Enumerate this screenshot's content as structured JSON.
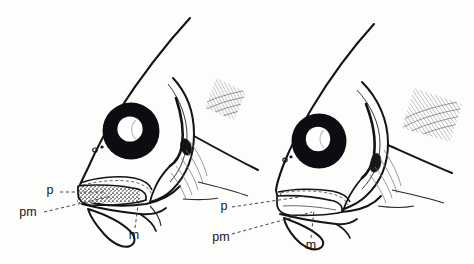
{
  "figure": {
    "name": "fish-head-jaw-anatomy-comparison",
    "background_color": "#fdfdfb",
    "ink_color": "#141418",
    "specimens": [
      {
        "id": "left-specimen",
        "position": "left",
        "description": "Fish head in lateral view with protruded jaws, stippled premaxilla",
        "labels": [
          {
            "key": "p",
            "text": "p",
            "x": 50,
            "y": 194
          },
          {
            "key": "pm",
            "text": "pm",
            "x": 24,
            "y": 216
          },
          {
            "key": "m",
            "text": "m",
            "x": 131,
            "y": 237
          }
        ]
      },
      {
        "id": "right-specimen",
        "position": "right",
        "description": "Fish head in lateral view with retracted jaws, unstippled premaxilla",
        "labels": [
          {
            "key": "p",
            "text": "p",
            "x": 222,
            "y": 209
          },
          {
            "key": "pm",
            "text": "pm",
            "x": 213,
            "y": 239
          },
          {
            "key": "m",
            "text": "m",
            "x": 308,
            "y": 247
          }
        ]
      }
    ],
    "legend_keys": [
      {
        "abbr": "p",
        "meaning": "palatine"
      },
      {
        "abbr": "pm",
        "meaning": "premaxilla"
      },
      {
        "abbr": "m",
        "meaning": "maxilla"
      }
    ]
  }
}
